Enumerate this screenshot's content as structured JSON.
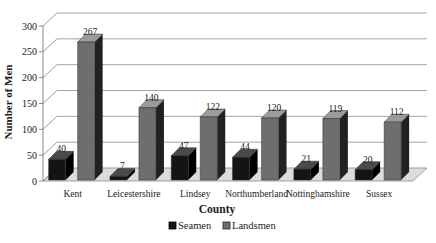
{
  "chart_data": {
    "type": "bar",
    "variant": "3d-clustered-column",
    "title": "",
    "xlabel": "County",
    "ylabel": "Number of Men",
    "categories": [
      "Kent",
      "Leicestershire",
      "Lindsey",
      "Northumberland",
      "Nottinghamshire",
      "Sussex"
    ],
    "series": [
      {
        "name": "Seamen",
        "values": [
          40,
          7,
          47,
          44,
          21,
          20
        ],
        "color_front": "#141414",
        "color_top": "#4a4a4a",
        "color_side": "#000000"
      },
      {
        "name": "Landsmen",
        "values": [
          267,
          140,
          122,
          120,
          119,
          112
        ],
        "color_front": "#6e6e6e",
        "color_top": "#9b9b9b",
        "color_side": "#212121"
      }
    ],
    "ylim": [
      0,
      300
    ],
    "ytick_step": 50,
    "yticks": [
      0,
      50,
      100,
      150,
      200,
      250,
      300
    ],
    "grid": true,
    "data_labels": true,
    "legend_position": "bottom"
  },
  "colors": {
    "background": "#ffffff",
    "gridline": "#8c8c8c",
    "axis": "#7d7d7d",
    "floor_fill": "#dcdcdc",
    "floor_edge": "#8c8c8c",
    "text": "#1a1a1a"
  }
}
